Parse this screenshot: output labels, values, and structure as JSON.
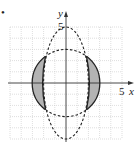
{
  "figure": {
    "bullet": "•",
    "axes": {
      "x_label": "x",
      "y_label": "y",
      "x_tick_label": "5",
      "y_tick_label": "5",
      "range": [
        -5,
        5
      ]
    },
    "curves": [
      {
        "name": "circle",
        "style": "solid",
        "equation": "x^2 + y^2 = 9"
      },
      {
        "name": "ellipse",
        "style": "dashed",
        "equation": "x^2/4 + y^2/25 = 1"
      }
    ],
    "shaded_regions": [
      "left lune between circle and ellipse",
      "right lune between circle and ellipse"
    ],
    "colors": {
      "grid": "#c8c8c8",
      "axis": "#333333",
      "curve": "#222222",
      "shade": "#b3b3b3"
    }
  }
}
